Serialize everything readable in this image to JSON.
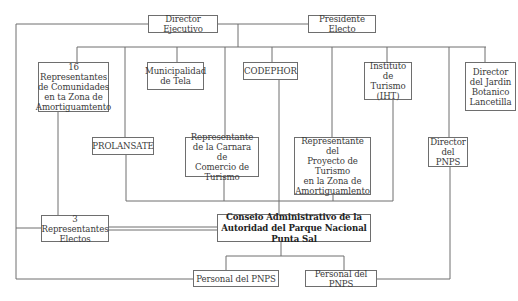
{
  "diagram": {
    "type": "organizational-chart",
    "nodes": {
      "director_ejecutivo": "Director Ejecutivo",
      "presidente_electo": "Presidente Electo",
      "representantes_comunidades": "16 Representantes\nde Comunidades\nen ta Zona de\nAmortiguamtento",
      "municipalidad": "Municipalidad\nde Tela",
      "codephor": "CODEPHOR",
      "instituto_turismo": "Instituto de\nTurismo\n(IHT)",
      "director_jardin": "Director\ndel Jardin\nBotanico\nLancetilla",
      "prolansate": "PROLANSATE",
      "representante_camara": "Representante\nde la Carnara de\nComercio de Turismo",
      "representante_proyecto": "Representante del\nProyecto de Turismo\nen la Zona de\nAmortiguamlento",
      "director_pnps": "Director\ndel PNPS",
      "representantes_electos": "3 Representantes\nElectos",
      "consejo": "Conseio Administrativo de la\nAutoridad del Parque Nacional Punta Sal",
      "personal_left": "Personal del PNPS",
      "personal_right": "Personal del PNPS"
    },
    "colors": {
      "line": "#6e6e6e",
      "border": "#6e6e6e",
      "text": "#3a3a3a",
      "background": "#ffffff"
    }
  }
}
